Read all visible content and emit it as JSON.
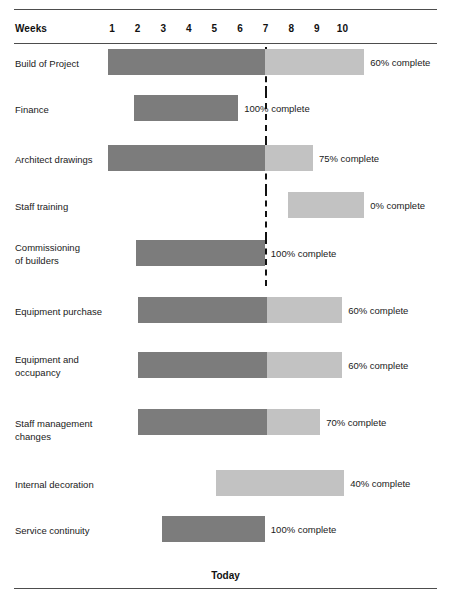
{
  "chart_data": {
    "type": "bar",
    "title": "",
    "subtitle": "",
    "xlabel": "Weeks",
    "ylabel": "",
    "axis": {
      "weeks_header": "Weeks",
      "tick_labels": [
        "1",
        "2",
        "3",
        "4",
        "5",
        "6",
        "7",
        "8",
        "9",
        "10"
      ],
      "xlim": [
        0,
        11
      ],
      "grid": false
    },
    "marker": {
      "label": "Today",
      "week": 7
    },
    "legend": {
      "position": "none",
      "entries": [
        {
          "label": "completed",
          "color": "#7c7c7c"
        },
        {
          "label": "remaining",
          "color": "#c2c2c2"
        }
      ]
    },
    "colors": {
      "done": "#7c7c7c",
      "todo": "#c2c2c2",
      "rule": "#4d4d4d",
      "text": "#1a1a1a",
      "today_line": "#111111"
    },
    "categories": [
      "Build of Project",
      "Finance",
      "Architect drawings",
      "Staff training",
      "Commissioning of builders",
      "Equipment purchase",
      "Equipment and occupancy",
      "Staff management changes",
      "Internal decoration",
      "Service continuity"
    ],
    "values": [
      60,
      100,
      75,
      0,
      100,
      60,
      60,
      70,
      40,
      100
    ],
    "tasks": [
      {
        "label": "Build of Project",
        "percent": 60,
        "note": "60% complete",
        "start_week": 0.85,
        "end_week": 10.85,
        "done_end_week": 6.97
      },
      {
        "label": "Finance",
        "percent": 100,
        "note": "100% complete",
        "start_week": 1.86,
        "end_week": 5.93,
        "done_end_week": 5.93
      },
      {
        "label": "Architect drawings",
        "percent": 75,
        "note": "75% complete",
        "start_week": 0.85,
        "end_week": 8.85,
        "done_end_week": 6.97
      },
      {
        "label": "Staff training",
        "percent": 0,
        "note": "0% complete",
        "start_week": 7.87,
        "end_week": 10.85,
        "done_end_week": 7.87
      },
      {
        "label": "Commissioning\nof builders",
        "percent": 100,
        "note": "100% complete",
        "start_week": 1.94,
        "end_week": 6.97,
        "done_end_week": 6.97
      },
      {
        "label": "Equipment purchase",
        "percent": 60,
        "note": "60% complete",
        "start_week": 2.02,
        "end_week": 9.99,
        "done_end_week": 7.05
      },
      {
        "label": "Equipment and\noccupancy",
        "percent": 60,
        "note": "60% complete",
        "start_week": 2.02,
        "end_week": 9.99,
        "done_end_week": 7.05
      },
      {
        "label": "Staff management\nchanges",
        "percent": 70,
        "note": "70% complete",
        "start_week": 2.02,
        "end_week": 9.13,
        "done_end_week": 7.05
      },
      {
        "label": "Internal decoration",
        "percent": 40,
        "note": "40% complete",
        "start_week": 5.07,
        "end_week": 10.07,
        "done_end_week": 5.07
      },
      {
        "label": "Service continuity",
        "percent": 100,
        "note": "100% complete",
        "start_week": 2.96,
        "end_week": 6.97,
        "done_end_week": 6.97
      }
    ]
  },
  "footer": {
    "today_caption": "Today"
  }
}
